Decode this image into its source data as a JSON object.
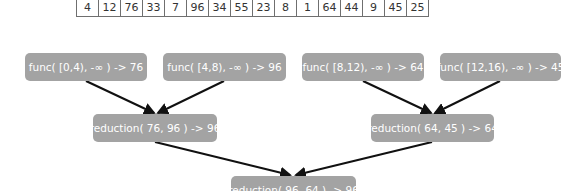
{
  "array": {
    "values": [
      "4",
      "12",
      "76",
      "33",
      "7",
      "96",
      "34",
      "55",
      "23",
      "8",
      "1",
      "64",
      "44",
      "9",
      "45",
      "25"
    ]
  },
  "func_nodes": [
    {
      "label": "func( [0,4), -∞ ) -> 76"
    },
    {
      "label": "func( [4,8), -∞ ) -> 96"
    },
    {
      "label": "func( [8,12), -∞ ) -> 64"
    },
    {
      "label": "func( [12,16), -∞ ) -> 45"
    }
  ],
  "reduction_nodes": [
    {
      "label": "reduction( 76, 96 ) -> 96"
    },
    {
      "label": "reduction( 64, 45 ) -> 64"
    }
  ],
  "final_node": {
    "label": "reduction( 96, 64 ) -> 96"
  },
  "colors": {
    "node_fill": "#a3a3a3",
    "node_text": "#ffffff",
    "arrow": "#111111",
    "table_border": "#6f6f6f"
  }
}
